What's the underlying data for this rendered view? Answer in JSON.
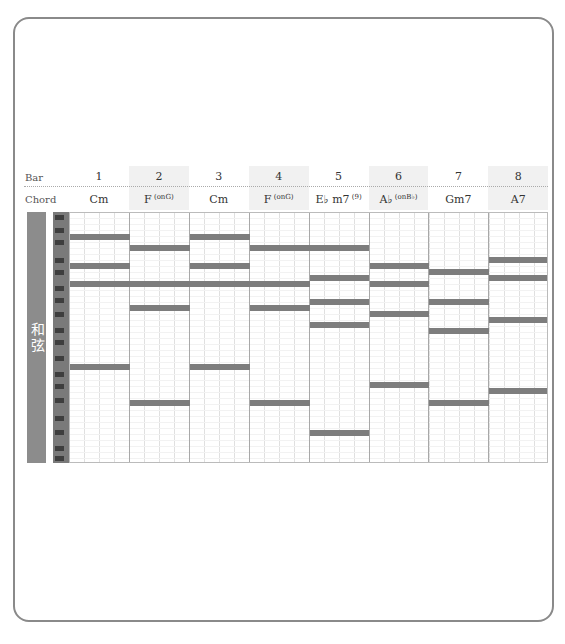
{
  "header": {
    "bar_label": "Bar",
    "chord_label": "Chord"
  },
  "side_label": "和弦",
  "bars": [
    {
      "number": "1",
      "chord": "Cm",
      "chord_sup": "",
      "shaded": false
    },
    {
      "number": "2",
      "chord": "F",
      "chord_sup": "(onG)",
      "shaded": true
    },
    {
      "number": "3",
      "chord": "Cm",
      "chord_sup": "",
      "shaded": false
    },
    {
      "number": "4",
      "chord": "F",
      "chord_sup": "(onG)",
      "shaded": true
    },
    {
      "number": "5",
      "chord": "E♭ m7",
      "chord_sup": "(9)",
      "shaded": false
    },
    {
      "number": "6",
      "chord": "A♭",
      "chord_sup": "(onB♭)",
      "shaded": true
    },
    {
      "number": "7",
      "chord": "Gm7",
      "chord_sup": "",
      "shaded": false
    },
    {
      "number": "8",
      "chord": "A7",
      "chord_sup": "",
      "shaded": true
    }
  ],
  "notes": [
    {
      "bar": 1,
      "y": 236
    },
    {
      "bar": 1,
      "y": 265
    },
    {
      "bar": 1,
      "y": 283
    },
    {
      "bar": 1,
      "y": 366
    },
    {
      "bar": 2,
      "y": 247
    },
    {
      "bar": 2,
      "y": 283
    },
    {
      "bar": 2,
      "y": 307
    },
    {
      "bar": 2,
      "y": 402
    },
    {
      "bar": 3,
      "y": 236
    },
    {
      "bar": 3,
      "y": 265
    },
    {
      "bar": 3,
      "y": 283
    },
    {
      "bar": 3,
      "y": 366
    },
    {
      "bar": 4,
      "y": 247
    },
    {
      "bar": 4,
      "y": 283
    },
    {
      "bar": 4,
      "y": 307
    },
    {
      "bar": 4,
      "y": 402
    },
    {
      "bar": 5,
      "y": 247
    },
    {
      "bar": 5,
      "y": 277
    },
    {
      "bar": 5,
      "y": 301
    },
    {
      "bar": 5,
      "y": 324
    },
    {
      "bar": 5,
      "y": 432
    },
    {
      "bar": 6,
      "y": 265
    },
    {
      "bar": 6,
      "y": 283
    },
    {
      "bar": 6,
      "y": 313
    },
    {
      "bar": 6,
      "y": 384
    },
    {
      "bar": 7,
      "y": 271
    },
    {
      "bar": 7,
      "y": 301
    },
    {
      "bar": 7,
      "y": 330
    },
    {
      "bar": 7,
      "y": 402
    },
    {
      "bar": 8,
      "y": 259
    },
    {
      "bar": 8,
      "y": 277
    },
    {
      "bar": 8,
      "y": 319
    },
    {
      "bar": 8,
      "y": 390
    }
  ],
  "black_keys_y": [
    215,
    228,
    240,
    258,
    270,
    286,
    298,
    312,
    328,
    340,
    356,
    372,
    384,
    398,
    416,
    430,
    446,
    456
  ],
  "colors": {
    "note_bar": "#7d7d7d",
    "side_label_bg": "#8c8c8c",
    "keyboard": "#7a7a7a",
    "border": "#8a8a8a"
  }
}
